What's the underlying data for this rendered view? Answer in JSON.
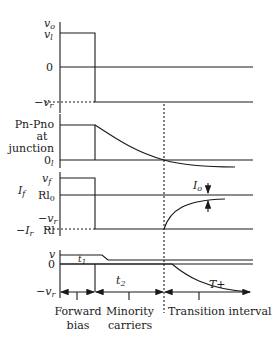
{
  "panel1": {
    "y_label_top": "v",
    "y_label_top_sub": "o",
    "level_high": "v",
    "level_high_sub": "l",
    "level_zero": "0",
    "level_low": "−v",
    "level_low_sub": "r"
  },
  "panel2": {
    "y_label_line1": "Pn-Pno",
    "y_label_line2": "at",
    "y_label_line3": "junction",
    "level_zero": "0",
    "level_zero_sub": "l"
  },
  "panel3": {
    "label_if": "I",
    "label_if_sub": "f",
    "label_vf": "v",
    "label_vf_sub": "f",
    "label_rl0": "Rl",
    "label_rl0_sub": "0",
    "label_vr": "−v",
    "label_vr_sub": "r",
    "label_ir": "−I",
    "label_ir_sub": "r",
    "label_rl": "Rl",
    "annotation_io": "I",
    "annotation_io_sub": "o"
  },
  "panel4": {
    "label_v": "v",
    "label_zero": "0",
    "label_vr": "−v",
    "label_vr_sub": "r",
    "label_t1": "t",
    "label_t1_sub": "1",
    "label_t2": "t",
    "label_t2_sub": "2",
    "label_tplus": "T+"
  },
  "intervals": {
    "forward_line1": "Forward",
    "forward_line2": "bias",
    "minority_line1": "Minority",
    "minority_line2": "carriers",
    "transition": "Transition interval"
  }
}
